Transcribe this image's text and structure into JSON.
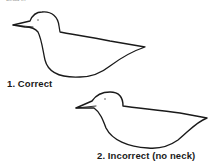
{
  "figure": {
    "top_fragment": "Lead in",
    "items": [
      {
        "number": "1.",
        "label": "1. Correct",
        "description": "Bird silhouette with neck"
      },
      {
        "number": "2.",
        "label": "2. Incorrect (no neck)",
        "description": "Bird silhouette without neck"
      }
    ],
    "line_color": "#1a1a1a",
    "background": "#ffffff"
  }
}
